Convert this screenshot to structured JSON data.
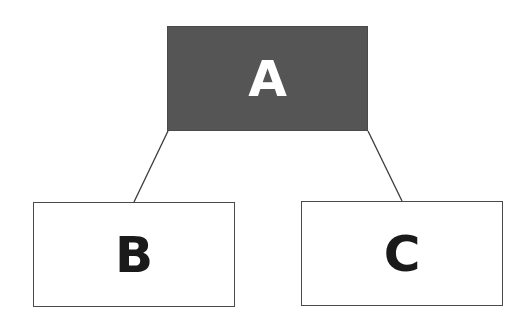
{
  "diagram": {
    "type": "tree",
    "nodes": [
      {
        "id": "A",
        "label": "A",
        "role": "root",
        "fill": "#555555",
        "text_color": "#ffffff"
      },
      {
        "id": "B",
        "label": "B",
        "role": "child",
        "fill": "#ffffff",
        "text_color": "#1a1a1a"
      },
      {
        "id": "C",
        "label": "C",
        "role": "child",
        "fill": "#ffffff",
        "text_color": "#1a1a1a"
      }
    ],
    "edges": [
      {
        "from": "A",
        "to": "B"
      },
      {
        "from": "A",
        "to": "C"
      }
    ],
    "edge_color": "#3a3a3a"
  }
}
